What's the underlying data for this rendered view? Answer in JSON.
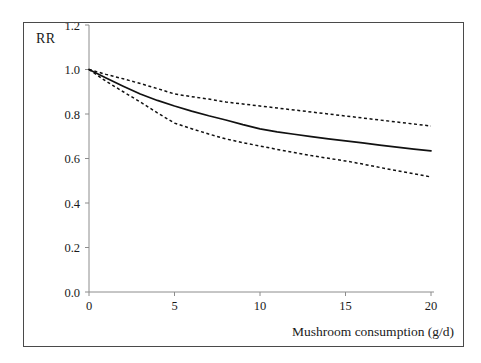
{
  "figure": {
    "y_axis_title": "RR",
    "x_axis_title": "Mushroom consumption (g/d)",
    "frame_color": "#4a4a4a",
    "axis_color": "#8c8c8c",
    "line_color": "#111111"
  },
  "chart_data": {
    "type": "line",
    "title": "",
    "xlabel": "Mushroom consumption (g/d)",
    "ylabel": "RR",
    "xlim": [
      0,
      20
    ],
    "ylim": [
      0.0,
      1.2
    ],
    "xticks": [
      0,
      5,
      10,
      15,
      20
    ],
    "xtick_labels": [
      "0",
      "5",
      "10",
      "15",
      "20"
    ],
    "yticks": [
      0.0,
      0.2,
      0.4,
      0.6,
      0.8,
      1.0,
      1.2
    ],
    "ytick_labels": [
      "0.0",
      "0.2",
      "0.4",
      "0.6",
      "0.8",
      "1.0",
      "1.2"
    ],
    "grid": false,
    "legend": "none",
    "x": [
      0,
      1,
      2,
      3,
      4,
      5,
      6,
      7,
      8,
      9,
      10,
      11,
      12,
      13,
      14,
      15,
      16,
      17,
      18,
      19,
      20
    ],
    "series": [
      {
        "name": "Upper 95% CI",
        "style": "dashed",
        "values": [
          1.0,
          0.978,
          0.958,
          0.937,
          0.914,
          0.89,
          0.878,
          0.867,
          0.854,
          0.845,
          0.836,
          0.827,
          0.818,
          0.809,
          0.8,
          0.791,
          0.782,
          0.773,
          0.764,
          0.755,
          0.746
        ]
      },
      {
        "name": "RR",
        "style": "solid",
        "values": [
          1.0,
          0.962,
          0.925,
          0.89,
          0.861,
          0.836,
          0.813,
          0.792,
          0.773,
          0.752,
          0.733,
          0.72,
          0.709,
          0.698,
          0.688,
          0.679,
          0.67,
          0.66,
          0.651,
          0.642,
          0.634
        ]
      },
      {
        "name": "Lower 95% CI",
        "style": "dashed",
        "values": [
          1.0,
          0.947,
          0.9,
          0.854,
          0.805,
          0.759,
          0.734,
          0.71,
          0.688,
          0.671,
          0.656,
          0.641,
          0.627,
          0.613,
          0.601,
          0.589,
          0.575,
          0.56,
          0.545,
          0.531,
          0.517
        ]
      }
    ]
  }
}
